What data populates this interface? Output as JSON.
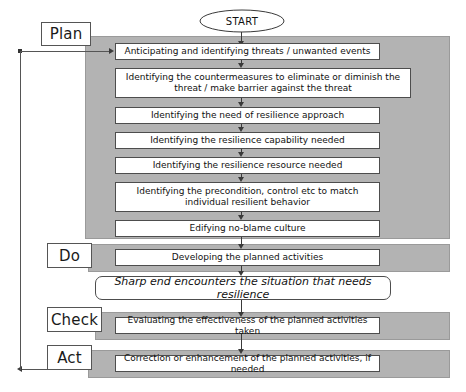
{
  "diagram": {
    "title_hidden": "",
    "colors": {
      "band_fill": "#b3b3b3",
      "box_fill": "#ffffff",
      "border": "#4d4d4d",
      "line": "#3a3a3a",
      "text": "#111111"
    },
    "start": {
      "label": "START"
    },
    "phases": [
      {
        "key": "plan",
        "label": "Plan"
      },
      {
        "key": "do",
        "label": "Do"
      },
      {
        "key": "check",
        "label": "Check"
      },
      {
        "key": "act",
        "label": "Act"
      }
    ],
    "plan_steps": [
      {
        "text": "Anticipating and identifying threats / unwanted events"
      },
      {
        "text": "Identifying the countermeasures to eliminate or diminish the threat / make barrier against the threat"
      },
      {
        "text": "Identifying the need of resilience approach"
      },
      {
        "text": "Identifying the resilience capability needed"
      },
      {
        "text": "Identifying the resilience resource needed"
      },
      {
        "text": "Identifying the precondition, control etc to match individual resilient behavior"
      },
      {
        "text": "Edifying no-blame culture"
      }
    ],
    "do_steps": [
      {
        "text": "Developing the planned activities"
      }
    ],
    "interlude": {
      "text": "Sharp end encounters the situation that needs resilience"
    },
    "check_steps": [
      {
        "text": "Evaluating the effectiveness of the planned activities taken"
      }
    ],
    "act_steps": [
      {
        "text": "Correction or enhancement of the planned activities, if needed"
      }
    ],
    "feedback_loop": {
      "description": "Act output loops back to the first Plan step"
    }
  }
}
